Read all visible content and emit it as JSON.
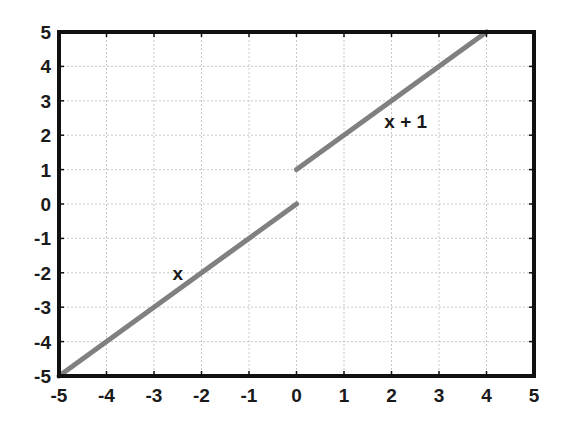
{
  "chart_data": {
    "type": "line",
    "title": "",
    "xlabel": "",
    "ylabel": "",
    "xlim": [
      -5,
      5
    ],
    "ylim": [
      -5,
      5
    ],
    "grid": true,
    "legend": null,
    "x_ticks": [
      "-5",
      "-4",
      "-3",
      "-2",
      "-1",
      "0",
      "1",
      "2",
      "3",
      "4",
      "5"
    ],
    "y_ticks": [
      "-5",
      "-4",
      "-3",
      "-2",
      "-1",
      "0",
      "1",
      "2",
      "3",
      "4",
      "5"
    ],
    "series": [
      {
        "name": "x",
        "x": [
          -5,
          0
        ],
        "y": [
          -5,
          0
        ],
        "color": "#808080"
      },
      {
        "name": "x + 1",
        "x": [
          0,
          4
        ],
        "y": [
          1,
          5
        ],
        "color": "#808080"
      }
    ],
    "annotations": [
      {
        "text": "x",
        "x": -2.5,
        "y": -2
      },
      {
        "text": "x + 1",
        "x": 2.3,
        "y": 2.4
      }
    ]
  },
  "colors": {
    "line": "#808080",
    "axes": "#111111",
    "grid": "#c8c8c8"
  }
}
